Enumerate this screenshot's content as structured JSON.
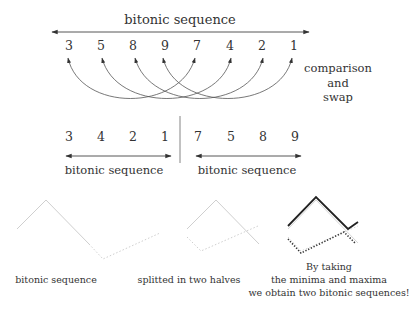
{
  "top": {
    "title": "bitonic sequence",
    "sequence": [
      "3",
      "5",
      "8",
      "9",
      "7",
      "4",
      "2",
      "1"
    ],
    "side_label": [
      "comparison",
      "and",
      "swap"
    ]
  },
  "middle": {
    "left_half": [
      "3",
      "4",
      "2",
      "1"
    ],
    "right_half": [
      "7",
      "5",
      "8",
      "9"
    ],
    "left_label": "bitonic sequence",
    "right_label": "bitonic sequence"
  },
  "bottom": {
    "captions": {
      "first": "bitonic sequence",
      "second": "splitted in two halves",
      "third": [
        "By taking",
        "the minima and maxima",
        "we obtain two bitonic sequences!"
      ]
    }
  },
  "colors": {
    "text": "#333333",
    "line": "#444444",
    "faded": "#cfcfcf",
    "bold": "#222222"
  }
}
